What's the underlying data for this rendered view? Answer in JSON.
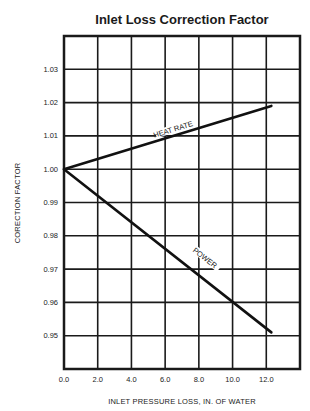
{
  "chart_data": {
    "type": "line",
    "title": "Inlet Loss Correction Factor",
    "xlabel": "INLET PRESSURE LOSS, IN. OF WATER",
    "ylabel": "CORECTION FACTOR",
    "xlim": [
      0,
      14
    ],
    "ylim": [
      0.94,
      1.04
    ],
    "grid": true,
    "x_ticks": [
      0,
      2,
      4,
      6,
      8,
      10,
      12
    ],
    "x_tick_labels": [
      "0.0",
      "2.0",
      "4.0",
      "6.0",
      "8.0",
      "10.0",
      "12.0"
    ],
    "y_ticks": [
      0.95,
      0.96,
      0.97,
      0.98,
      0.99,
      1.0,
      1.01,
      1.02,
      1.03
    ],
    "y_tick_labels": [
      "0.95",
      "0.96",
      "0.97",
      "0.98",
      "0.99",
      "1.00",
      "1.01",
      "1.02",
      "1.03"
    ],
    "series": [
      {
        "name": "HEAT RATE",
        "x": [
          0,
          12.3
        ],
        "y": [
          1.0,
          1.019
        ]
      },
      {
        "name": "POWER",
        "x": [
          0,
          12.3
        ],
        "y": [
          1.0,
          0.951
        ]
      }
    ],
    "annotations": [
      {
        "text": "HEAT RATE",
        "x": 6.5,
        "y": 1.0115
      },
      {
        "text": "POWER",
        "x": 8.3,
        "y": 0.973
      }
    ],
    "legend": "none (inline labels)"
  }
}
